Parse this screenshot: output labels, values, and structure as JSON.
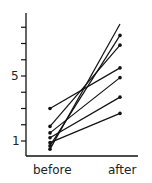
{
  "chart_data": {
    "type": "line",
    "title": "",
    "xlabel": "",
    "ylabel": "",
    "categories": [
      "before",
      "after"
    ],
    "ylim": [
      0.2,
      8.8
    ],
    "yticks": [
      1,
      2,
      3,
      4,
      5,
      6,
      7,
      8
    ],
    "ytick_labels": {
      "1": "1",
      "5": "5"
    },
    "grid": false,
    "legend": "none",
    "series": [
      {
        "name": "subject 1",
        "values": [
          3.0,
          5.5
        ]
      },
      {
        "name": "subject 2",
        "values": [
          1.9,
          6.9
        ]
      },
      {
        "name": "subject 3",
        "values": [
          1.5,
          4.9
        ]
      },
      {
        "name": "subject 4",
        "values": [
          1.2,
          3.7
        ]
      },
      {
        "name": "subject 5",
        "values": [
          0.9,
          2.7
        ]
      },
      {
        "name": "subject 6",
        "values": [
          0.7,
          7.5
        ]
      },
      {
        "name": "subject 7",
        "values": [
          0.5,
          8.2
        ]
      }
    ]
  },
  "axis": {
    "y_label_1": "1",
    "y_label_5": "5",
    "x_before": "before",
    "x_after": "after"
  }
}
